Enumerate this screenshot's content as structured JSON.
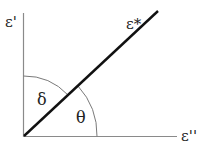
{
  "diagram": {
    "type": "phasor-angle-diagram",
    "axes": {
      "vertical_label": "ε'",
      "horizontal_label": "ε''"
    },
    "vector_label": "ε*",
    "angles": {
      "delta_label": "δ",
      "theta_label": "θ"
    },
    "colors": {
      "axis": "#888888",
      "vector": "#111111",
      "arc": "#777777",
      "text": "#222222"
    }
  }
}
